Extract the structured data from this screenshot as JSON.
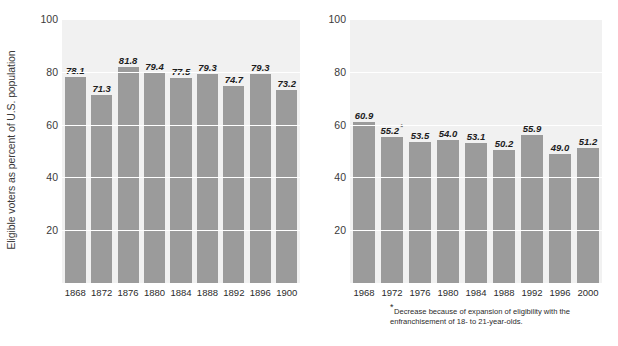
{
  "chart_data": [
    {
      "id": "left",
      "type": "bar",
      "title": "",
      "xlabel": "",
      "ylabel": "Eligible voters as percent of U.S. population",
      "ylim": [
        0,
        100
      ],
      "yticks": [
        100,
        80,
        60,
        40,
        20
      ],
      "grid": true,
      "legend": "none",
      "bar_color": "#9b9b9b",
      "plot_background": "#f1f1f1",
      "gridline_color": "#ffffff",
      "categories": [
        "1868",
        "1872",
        "1876",
        "1880",
        "1884",
        "1888",
        "1892",
        "1896",
        "1900"
      ],
      "values": [
        78.1,
        71.3,
        81.8,
        79.4,
        77.5,
        79.3,
        74.7,
        79.3,
        73.2
      ],
      "value_labels": [
        "78.1",
        "71.3",
        "81.8",
        "79.4",
        "77.5",
        "79.3",
        "74.7",
        "79.3",
        "73.2"
      ],
      "label_notes": [
        "",
        "",
        "",
        "",
        "",
        "",
        "",
        "",
        ""
      ]
    },
    {
      "id": "right",
      "type": "bar",
      "title": "",
      "xlabel": "",
      "ylabel": "",
      "ylim": [
        0,
        100
      ],
      "yticks": [
        100,
        80,
        60,
        40,
        20
      ],
      "grid": true,
      "legend": "none",
      "bar_color": "#9b9b9b",
      "plot_background": "#f1f1f1",
      "gridline_color": "#ffffff",
      "categories": [
        "1968",
        "1972",
        "1976",
        "1980",
        "1984",
        "1988",
        "1992",
        "1996",
        "2000"
      ],
      "values": [
        60.9,
        55.2,
        53.5,
        54.0,
        53.1,
        50.2,
        55.9,
        49.0,
        51.2
      ],
      "value_labels": [
        "60.9",
        "55.2",
        "53.5",
        "54.0",
        "53.1",
        "50.2",
        "55.9",
        "49.0",
        "51.2"
      ],
      "label_notes": [
        "",
        "*",
        "",
        "",
        "",
        "",
        "",
        "",
        ""
      ],
      "annotation": {
        "marker": "*",
        "text": "Decrease because of expansion of eligibility with the enfranchisement of 18- to 21-year-olds."
      }
    }
  ]
}
